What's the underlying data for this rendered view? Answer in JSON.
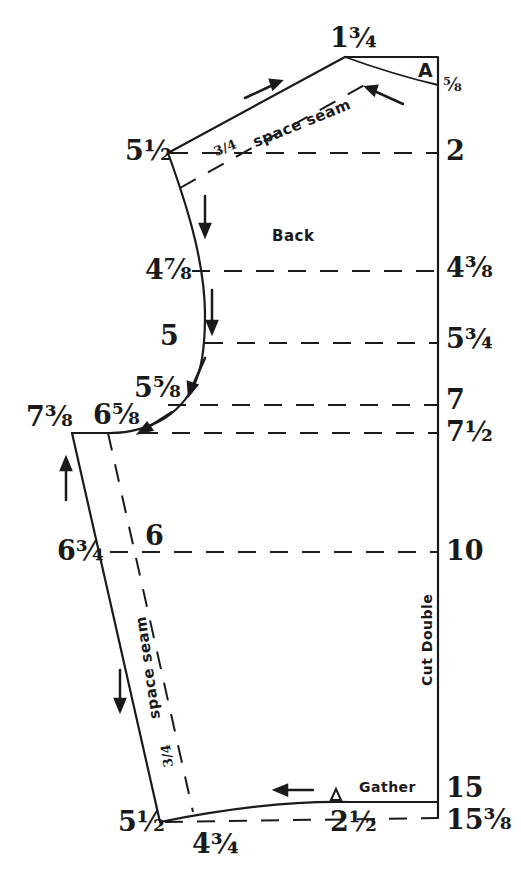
{
  "diagram": {
    "title": "Back",
    "colors": {
      "ink": "#1a1a1a",
      "paper": "#ffffff"
    },
    "annotations": {
      "shoulder_seam": "space seam",
      "shoulder_seam_allowance": "3/4",
      "side_seam": "space seam",
      "side_seam_allowance": "3/4",
      "fold": "Cut Double",
      "gather": "Gather",
      "notch_mark": "A"
    },
    "left_labels": [
      {
        "id": "neck-top",
        "text": "1¾"
      },
      {
        "id": "shoulder-left",
        "text": "5½"
      },
      {
        "id": "armhole-1",
        "text": "4⅞"
      },
      {
        "id": "armhole-2",
        "text": "5"
      },
      {
        "id": "armhole-3",
        "text": "5⅝"
      },
      {
        "id": "armhole-4",
        "text": "6⅝"
      },
      {
        "id": "underarm-outer",
        "text": "7⅜"
      },
      {
        "id": "side-waist-outer",
        "text": "6¾"
      },
      {
        "id": "side-waist-inner",
        "text": "6"
      },
      {
        "id": "hem-left",
        "text": "5½"
      },
      {
        "id": "hem-inner",
        "text": "4¾"
      },
      {
        "id": "hem-mid",
        "text": "2½"
      }
    ],
    "right_labels": [
      {
        "id": "r-neck",
        "text": "⅝"
      },
      {
        "id": "r-2",
        "text": "2"
      },
      {
        "id": "r-4-3-8",
        "text": "4⅜"
      },
      {
        "id": "r-5-3-4",
        "text": "5¾"
      },
      {
        "id": "r-7",
        "text": "7"
      },
      {
        "id": "r-7-1-2",
        "text": "7½"
      },
      {
        "id": "r-10",
        "text": "10"
      },
      {
        "id": "r-15",
        "text": "15"
      },
      {
        "id": "r-15-3-8",
        "text": "15⅜"
      }
    ]
  }
}
